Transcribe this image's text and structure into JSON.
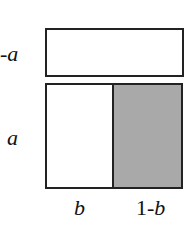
{
  "diagram": {
    "labels": {
      "top_row": "-a",
      "bottom_row": "a",
      "left_col": "b",
      "right_col_prefix": "1-",
      "right_col_var": "b"
    },
    "colors": {
      "stroke": "#222222",
      "shaded": "#a9a9a9",
      "background": "#ffffff"
    }
  }
}
